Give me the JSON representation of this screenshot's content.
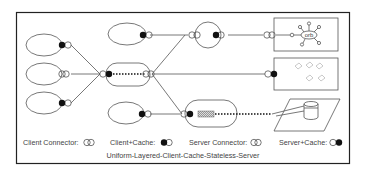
{
  "diagram": {
    "caption": "Uniform-Layered-Client-Cache-Stateless-Server",
    "orb_label": "orb",
    "legend": [
      {
        "label": "Client Connector:",
        "symbol": "client-connector"
      },
      {
        "label": "Client+Cache:",
        "symbol": "client-cache"
      },
      {
        "label": "Server Connector:",
        "symbol": "server-connector"
      },
      {
        "label": "Server+Cache:",
        "symbol": "server-cache"
      }
    ],
    "colors": {
      "stroke": "#555555",
      "fill_dark": "#111111",
      "frame": "#222222"
    }
  }
}
